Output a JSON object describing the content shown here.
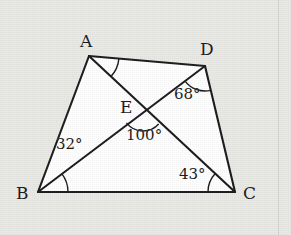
{
  "figure": {
    "kind": "geometry-diagram",
    "background_color": "#e9e9e6",
    "interior_fill": "#ffffff",
    "stroke_color": "#1a1a1c",
    "canvas": {
      "width": 291,
      "height": 235
    },
    "points": {
      "A": {
        "label": "A",
        "x": 89,
        "y": 56,
        "label_x": 80,
        "label_y": 33
      },
      "B": {
        "label": "B",
        "x": 38,
        "y": 192,
        "label_x": 16,
        "label_y": 185
      },
      "C": {
        "label": "C",
        "x": 235,
        "y": 192,
        "label_x": 243,
        "label_y": 185
      },
      "D": {
        "label": "D",
        "x": 205,
        "y": 66,
        "label_x": 200,
        "label_y": 41
      },
      "E": {
        "label": "E",
        "x": 143,
        "y": 110,
        "label_x": 120,
        "label_y": 99
      }
    },
    "segments": [
      {
        "name": "side-AB",
        "from": "A",
        "to": "B"
      },
      {
        "name": "side-AD",
        "from": "A",
        "to": "D"
      },
      {
        "name": "side-BC",
        "from": "B",
        "to": "C"
      },
      {
        "name": "side-DC",
        "from": "D",
        "to": "C"
      },
      {
        "name": "diagonal-AC",
        "from": "A",
        "to": "C"
      },
      {
        "name": "diagonal-BD",
        "from": "B",
        "to": "D"
      }
    ],
    "angles": [
      {
        "name": "angle-at-D",
        "vertex": "D",
        "value": "68°",
        "measure": 68,
        "label_x": 174,
        "label_y": 87,
        "arc_radius": 26,
        "arc_start_deg": 200,
        "arc_end_deg": 250
      },
      {
        "name": "angle-at-E",
        "vertex": "E",
        "value": "100°",
        "measure": 100,
        "label_x": 126,
        "label_y": 128,
        "arc_radius": 22,
        "arc_start_deg": 40,
        "arc_end_deg": 140
      },
      {
        "name": "angle-at-B",
        "vertex": "B",
        "value": "32°",
        "measure": 32,
        "label_x": 56,
        "label_y": 137,
        "arc_radius": 30,
        "arc_start_deg": -32,
        "arc_end_deg": 0
      },
      {
        "name": "angle-at-C",
        "vertex": "C",
        "value": "43°",
        "measure": 43,
        "label_x": 179,
        "label_y": 167,
        "arc_radius": 28,
        "arc_start_deg": 180,
        "arc_end_deg": 215
      },
      {
        "name": "angle-at-A",
        "vertex": "A",
        "value": "",
        "measure": null,
        "label_x": 0,
        "label_y": 0,
        "arc_radius": 30,
        "arc_start_deg": 0,
        "arc_end_deg": 56
      }
    ],
    "margin_rule_x": 278
  }
}
